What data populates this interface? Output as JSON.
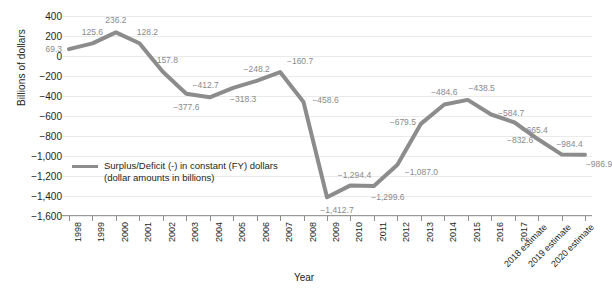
{
  "chart_data": {
    "type": "line",
    "title": "",
    "xlabel": "Year",
    "ylabel": "Billions of dollars",
    "ylim": [
      -1600,
      400
    ],
    "ytick_step": 200,
    "grid": true,
    "legend_position": "inside-lower-left",
    "legend": [
      "Surplus/Deficit (-) in constant (FY) dollars",
      "(dollar amounts in billions)"
    ],
    "line_color": "#8c8c8c",
    "label_color": "#8a8a8a",
    "grid_color": "#e9eaec",
    "categories": [
      "1998",
      "1999",
      "2000",
      "2001",
      "2002",
      "2003",
      "2004",
      "2005",
      "2006",
      "2007",
      "2008",
      "2009",
      "2010",
      "2011",
      "2012",
      "2013",
      "2014",
      "2015",
      "2016",
      "2017",
      "2018 estimate",
      "2019 estimate",
      "2020 estimate"
    ],
    "values": [
      69.3,
      125.6,
      236.2,
      128.2,
      -157.8,
      -377.6,
      -412.7,
      -318.3,
      -248.2,
      -160.7,
      -458.6,
      -1412.7,
      -1294.4,
      -1299.6,
      -1087.0,
      -679.5,
      -484.6,
      -438.5,
      -584.7,
      -665.4,
      -832.6,
      -984.4,
      -986.9
    ],
    "point_labels": [
      "69.3",
      "125.6",
      "236.2",
      "128.2",
      "−157.8",
      "−377.6",
      "−412.7",
      "−318.3",
      "−248.2",
      "−160.7",
      "−458.6",
      "−1,412.7",
      "−1,294.4",
      "−1,299.6",
      "−1,087.0",
      "−679.5",
      "−484.6",
      "−438.5",
      "−584.7",
      "−665.4",
      "−832.6",
      "−984.4",
      "−986.9"
    ],
    "ytick_labels": [
      "400",
      "200",
      "0",
      "−200",
      "−400",
      "−600",
      "−800",
      "−1,000",
      "−1,200",
      "−1,400",
      "−1,600"
    ],
    "ytick_values": [
      400,
      200,
      0,
      -200,
      -400,
      -600,
      -800,
      -1000,
      -1200,
      -1400,
      -1600
    ],
    "zero_annotation": "69.3"
  }
}
